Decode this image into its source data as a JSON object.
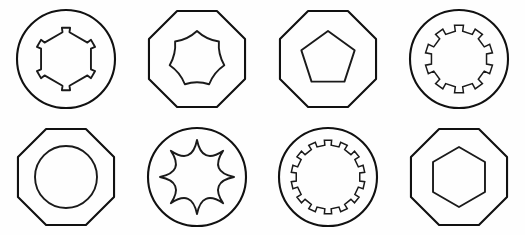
{
  "figure": {
    "width": 525,
    "height": 235,
    "background_color": "#fefefe",
    "stroke_color": "#111111",
    "rows": 2,
    "columns": 4
  },
  "shapes": [
    {
      "index": 1,
      "position": "row-1-col-1",
      "outer": "circle",
      "inner": "notched-hexagon",
      "inner_sides": 6,
      "inner_feature_count": 6,
      "label": "circle-with-notched-hexagon"
    },
    {
      "index": 2,
      "position": "row-1-col-2",
      "outer": "octagon",
      "inner": "seven-lobe-torx",
      "inner_sides": 7,
      "inner_feature_count": 7,
      "label": "octagon-with-seven-lobe-torx"
    },
    {
      "index": 3,
      "position": "row-1-col-3",
      "outer": "octagon",
      "inner": "pentagon",
      "inner_sides": 5,
      "inner_feature_count": 5,
      "label": "octagon-with-pentagon"
    },
    {
      "index": 4,
      "position": "row-1-col-4",
      "outer": "circle",
      "inner": "splined-circle",
      "inner_sides": 0,
      "inner_feature_count": 10,
      "label": "circle-with-ten-tooth-spline"
    },
    {
      "index": 5,
      "position": "row-2-col-1",
      "outer": "octagon",
      "inner": "circle",
      "inner_sides": 0,
      "inner_feature_count": 0,
      "label": "octagon-with-circle"
    },
    {
      "index": 6,
      "position": "row-2-col-2",
      "outer": "circle",
      "inner": "eight-point-star",
      "inner_sides": 8,
      "inner_feature_count": 8,
      "label": "circle-with-eight-point-star"
    },
    {
      "index": 7,
      "position": "row-2-col-3",
      "outer": "circle",
      "inner": "splined-circle",
      "inner_sides": 0,
      "inner_feature_count": 14,
      "label": "circle-with-fourteen-tooth-spline"
    },
    {
      "index": 8,
      "position": "row-2-col-4",
      "outer": "octagon",
      "inner": "hexagon",
      "inner_sides": 6,
      "inner_feature_count": 6,
      "label": "octagon-with-hexagon"
    }
  ]
}
